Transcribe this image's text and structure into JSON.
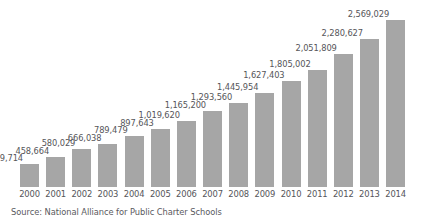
{
  "chart_data": {
    "type": "bar",
    "title": "",
    "subtitle": "",
    "xlabel": "",
    "ylabel": "",
    "grid": false,
    "legend": null,
    "ylim": [
      0,
      2569029
    ],
    "categories": [
      "2000",
      "2001",
      "2002",
      "2003",
      "2004",
      "2005",
      "2006",
      "2007",
      "2008",
      "2009",
      "2010",
      "2011",
      "2012",
      "2013",
      "2014"
    ],
    "values": [
      349714,
      458664,
      580029,
      666038,
      789479,
      897643,
      1019620,
      1165200,
      1293560,
      1445954,
      1627403,
      1805002,
      2051809,
      2280627,
      2569029
    ],
    "value_labels": [
      "349,714",
      "458,664",
      "580,029",
      "666,038",
      "789,479",
      "897,643",
      "1,019,620",
      "1,165,200",
      "1,293,560",
      "1,445,954",
      "1,627,403",
      "1,805,002",
      "2,051,809",
      "2,280,627",
      "2,569,029"
    ],
    "bar_color": "#a6a6a6",
    "label_color": "#56565a",
    "background_color": "#ffffff"
  },
  "source": {
    "text": "Source: National Alliance for Public Charter Schools"
  }
}
